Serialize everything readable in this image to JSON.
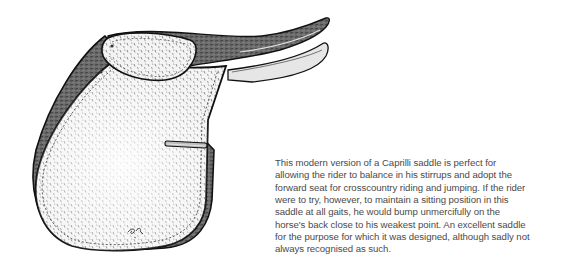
{
  "illustration": {
    "subject": "Caprilli saddle drawing",
    "signature": "ER"
  },
  "caption": {
    "lines": [
      "This modern version of a Caprilli saddle is perfect for",
      "allowing the rider to balance in his stirrups and adopt the",
      "forward seat for crosscountry riding and jumping. If the rider",
      "were to try, however, to maintain a sitting position in this",
      "saddle at all gaits, he would bump unmercifully on the",
      "horse's back close to his weakest point. An excellent saddle",
      "for the purpose for which it was designed, although sadly not",
      "always recognised as such."
    ]
  }
}
